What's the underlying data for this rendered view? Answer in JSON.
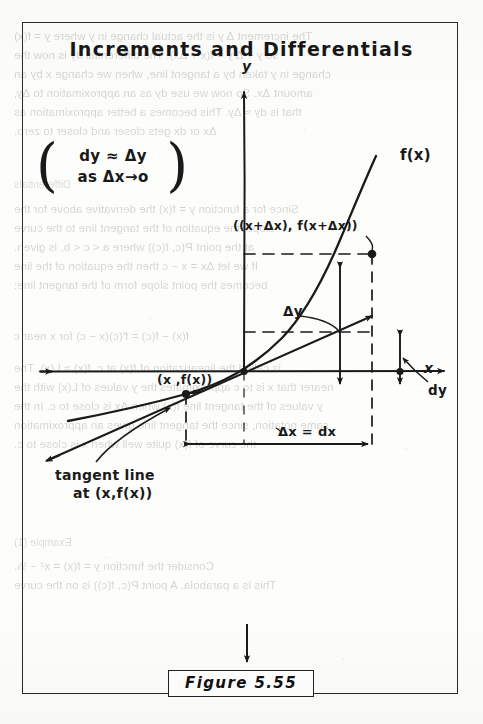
{
  "figure": {
    "title": "Increments and Differentials",
    "caption": "Figure 5.55"
  },
  "formula_box": {
    "paren_left": "(",
    "paren_right": ")",
    "line1": "dy ≈ Δy",
    "line2": "as Δx→o"
  },
  "labels": {
    "upper_point": "((x+Δx), f(x+Δx))",
    "lower_point": "(x ,f(x))",
    "delta_y": "Δy",
    "dy": "dy",
    "delta_x": "Δx = dx",
    "axis_x": "x",
    "axis_y": "y",
    "curve": "f(x)",
    "tangent_line1": "tangent line",
    "tangent_line2": "at (x,f(x))"
  },
  "bleed_text": {
    "lines": [
      "The increment Δ y is the actual change in y where y = f(x)",
      "so y + Δ y = f(x + Δx). The differential dy is now the",
      "change in y taken by a tangent line, when we change x by an",
      "amount Δx. So now we use dy as an approximation to Δy,",
      "that is dy ≈ Δy. This becomes a better approximation as",
      "Δx or dx gets closer and closer to zero.",
      "Differentials",
      "Since for a function y = f(x) the derivative above for the",
      "slope, the equation of the tangent line to the curve",
      "at the point P(c, f(c)) where a < c < b, is given.",
      "If we let Δx = x − c then the equation of the line",
      "becomes the point slope form of the tangent line:",
      "f(x) − f(c) = f'(c)(x − c) for x near c",
      "is called the linearization of f(x) at c. f(x) ≈ L(x). The",
      "nearer that x is to c approximates the y values of L(x) with the",
      "y values of the tangent line f(x) when Δx is close to c. In the",
      "same notation, since the tangent line gives an approximation",
      "the curve of f(x) quite well when x is close to c.",
      "Example (1)",
      "Consider the function y = f(x) = x² − ⅓.",
      "This is a parabola. A point P(c, f(c)) is on the curve"
    ]
  }
}
